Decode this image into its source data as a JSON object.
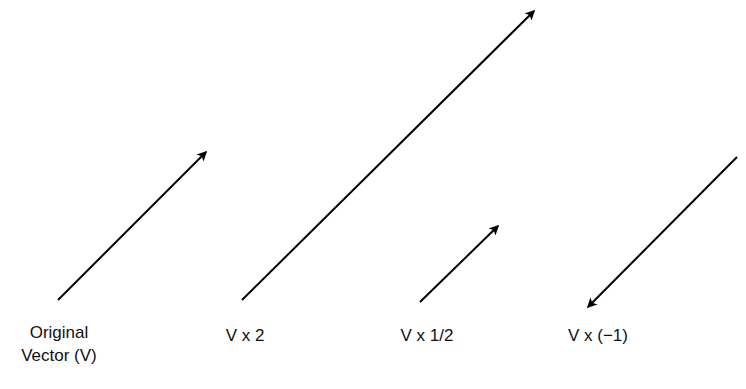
{
  "diagram": {
    "stroke_color": "#000000",
    "vectors": [
      {
        "name": "original",
        "label_line1": "Original",
        "label_line2": "Vector (V)",
        "x1": 58,
        "y1": 300,
        "x2": 206,
        "y2": 152
      },
      {
        "name": "times-two",
        "label_line1": "V x 2",
        "x1": 242,
        "y1": 300,
        "x2": 534,
        "y2": 11
      },
      {
        "name": "times-half",
        "label_line1": "V x 1/2",
        "x1": 420,
        "y1": 302,
        "x2": 498,
        "y2": 226
      },
      {
        "name": "times-negative-one",
        "label_line1": "V x (−1)",
        "x1": 737,
        "y1": 157,
        "x2": 588,
        "y2": 307
      }
    ]
  }
}
